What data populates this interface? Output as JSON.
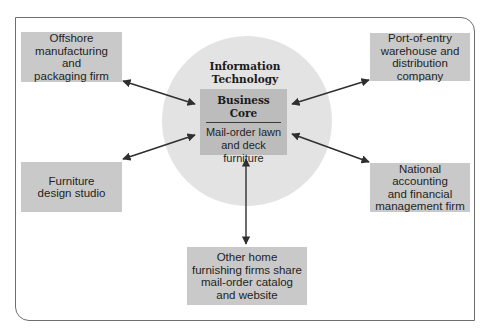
{
  "diagram": {
    "center": {
      "ring_label_line1": "Information",
      "ring_label_line2": "Technology",
      "core_title_line1": "Business",
      "core_title_line2": "Core",
      "core_desc_line1": "Mail-order lawn",
      "core_desc_line2": "and deck furniture"
    },
    "partners": {
      "offshore": {
        "lines": [
          "Offshore",
          "manufacturing and",
          "packaging firm"
        ]
      },
      "port_of_entry": {
        "lines": [
          "Port-of-entry",
          "warehouse and",
          "distribution company"
        ]
      },
      "furniture_design": {
        "lines": [
          "Furniture",
          "design studio"
        ]
      },
      "national_accounting": {
        "lines": [
          "National accounting",
          "and financial",
          "management firm"
        ]
      },
      "other_home_furnishing": {
        "lines": [
          "Other home",
          "furnishing firms share",
          "mail-order catalog",
          "and website"
        ]
      }
    },
    "colors": {
      "partner_box": "#c9c9c9",
      "core_box": "#bcbcbc",
      "ring": "#e3e3e3",
      "arrow": "#2f2f2f",
      "frame": "#6d6d6d"
    }
  }
}
